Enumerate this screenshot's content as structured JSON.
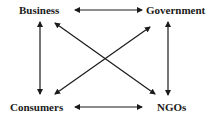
{
  "diagram": {
    "nodes": {
      "business": "Business",
      "government": "Government",
      "consumers": "Consumers",
      "ngos": "NGOs"
    },
    "edges": [
      {
        "from": "Business",
        "to": "Government",
        "type": "bidirectional"
      },
      {
        "from": "Consumers",
        "to": "NGOs",
        "type": "bidirectional"
      },
      {
        "from": "Business",
        "to": "Consumers",
        "type": "bidirectional"
      },
      {
        "from": "Government",
        "to": "NGOs",
        "type": "bidirectional"
      },
      {
        "from": "Business",
        "to": "NGOs",
        "type": "bidirectional"
      },
      {
        "from": "Government",
        "to": "Consumers",
        "type": "bidirectional"
      }
    ],
    "color": "#1a1a1a"
  }
}
